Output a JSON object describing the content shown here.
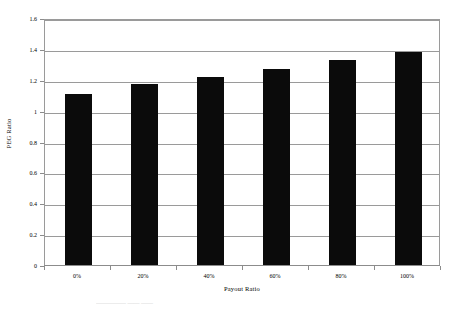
{
  "chart_data": {
    "type": "bar",
    "title": "",
    "subtitle": "",
    "categories": [
      "0%",
      "20%",
      "40%",
      "60%",
      "80%",
      "100%"
    ],
    "values": [
      1.11,
      1.17,
      1.22,
      1.27,
      1.33,
      1.38
    ],
    "series": [
      {
        "name": "PEG Ratio",
        "values": [
          1.11,
          1.17,
          1.22,
          1.27,
          1.33,
          1.38
        ]
      }
    ],
    "xlabel": "Payout Ratio",
    "ylabel": "PEG Ratio",
    "ylim": [
      0,
      1.6
    ],
    "ytick_labels": [
      "0",
      "0.2",
      "0.4",
      "0.6",
      "0.8",
      "1",
      "1.2",
      "1.4",
      "1.6"
    ],
    "ytick_values": [
      0,
      0.2,
      0.4,
      0.6,
      0.8,
      1,
      1.2,
      1.4,
      1.6
    ],
    "grid": "horizontal",
    "legend": "none",
    "bar_color": "#0b0b0b",
    "grid_color": "#9a9a9a",
    "axis_color": "#8c8c8c",
    "background": "#ffffff"
  },
  "caption": {
    "clipped_text": "————— —— ——"
  }
}
